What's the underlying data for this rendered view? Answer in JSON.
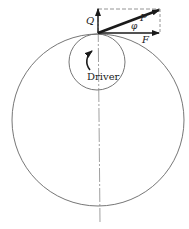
{
  "diagram": {
    "labels": {
      "q": "Q",
      "p": "P",
      "phi": "φ",
      "f": "F",
      "driver": "Driver"
    },
    "colors": {
      "line": "#555555",
      "arrow": "#1a1a1a",
      "dash": "#888888"
    }
  }
}
